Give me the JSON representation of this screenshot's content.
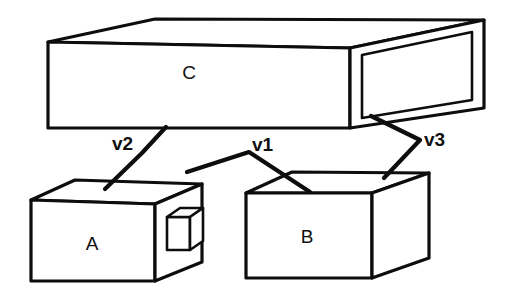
{
  "diagram": {
    "background_color": "#ffffff",
    "line_color": "#0d0d0d",
    "width": 510,
    "height": 304,
    "boxes": [
      {
        "id": "C",
        "label": "C",
        "description": "large flat horizontal slab at top with open rectangular right end",
        "label_x": 189,
        "label_y": 74
      },
      {
        "id": "A",
        "label": "A",
        "description": "lower-left cuboid with small cube attached on right side face",
        "label_x": 92,
        "label_y": 245
      },
      {
        "id": "B",
        "label": "B",
        "description": "lower-right cuboid",
        "label_x": 307,
        "label_y": 238
      }
    ],
    "vectors": [
      {
        "id": "v2",
        "label": "v2",
        "from": "C",
        "to": "A",
        "label_x": 112,
        "label_y": 145
      },
      {
        "id": "v1",
        "label": "v1",
        "from": "A",
        "to": "B",
        "label_x": 252,
        "label_y": 146
      },
      {
        "id": "v3",
        "label": "v3",
        "from": "C",
        "to": "B",
        "label_x": 424,
        "label_y": 141
      }
    ]
  }
}
